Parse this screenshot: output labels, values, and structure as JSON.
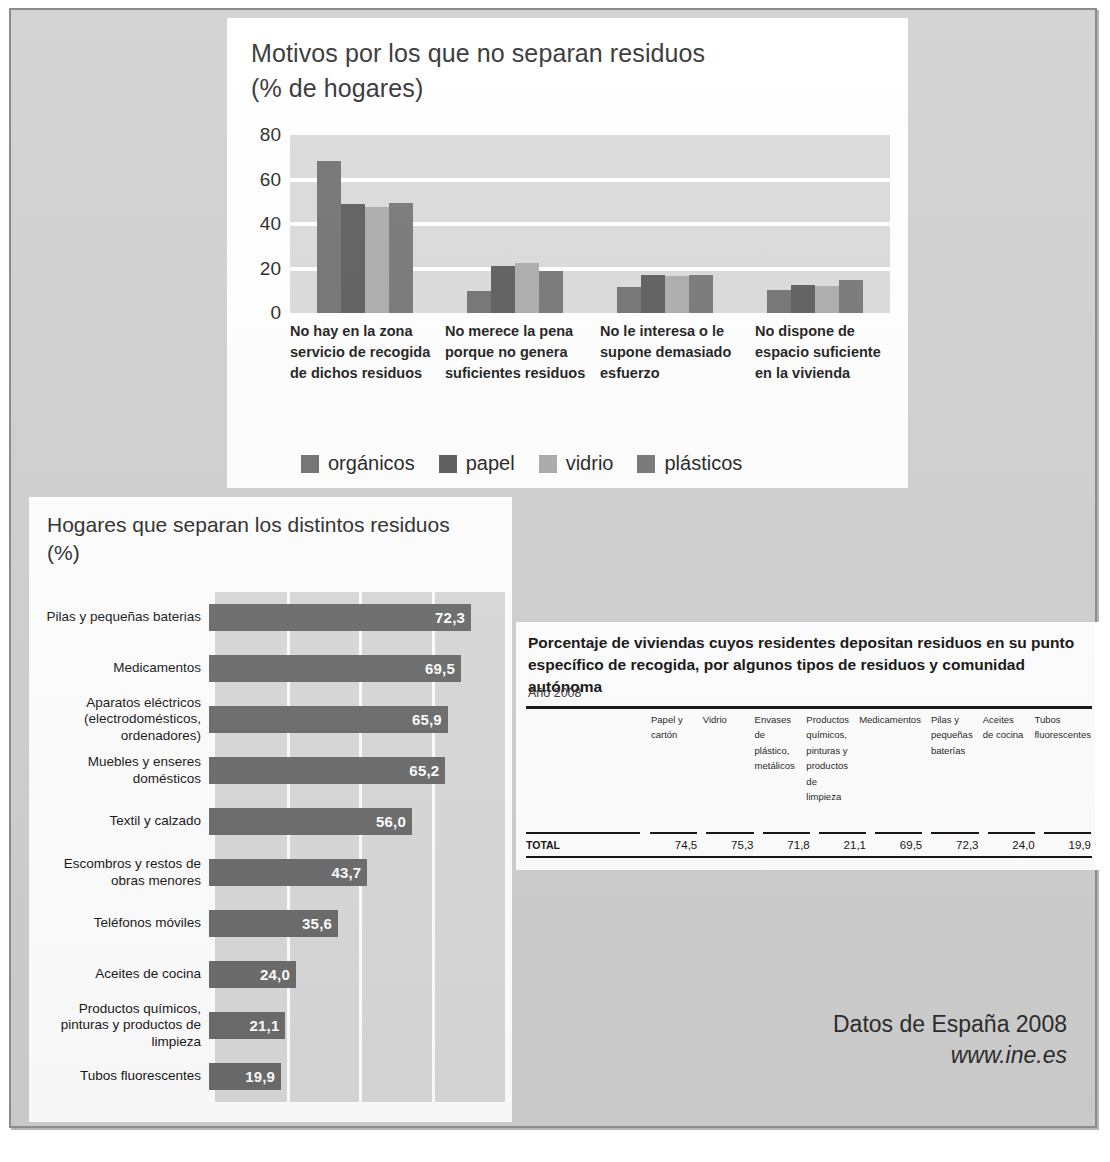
{
  "footer": {
    "line1": "Datos de España 2008",
    "line2": "www.ine.es"
  },
  "panel_top": {
    "title_line1": "Motivos por los que no separan residuos",
    "title_line2": "(% de hogares)"
  },
  "panel_left": {
    "title_line1": "Hogares que separan los distintos residuos",
    "title_line2": "(%)"
  },
  "table": {
    "title_line1": "Porcentaje de viviendas cuyos residentes depositan residuos en su punto",
    "title_line2": "específico de recogida, por algunos tipos de residuos y comunidad autónoma",
    "subtitle": "Año 2008",
    "row_label_header": "",
    "headers": [
      "Papel y cartón",
      "Vidrio",
      "Envases de plástico, metálicos",
      "Productos químicos, pinturas y productos de limpieza",
      "Medicamentos",
      "Pilas y pequeñas baterías",
      "Aceites de cocina",
      "Tubos fluorescentes"
    ],
    "rows": [
      {
        "label": "TOTAL",
        "values": [
          "74,5",
          "75,3",
          "71,8",
          "21,1",
          "69,5",
          "72,3",
          "24,0",
          "19,9"
        ]
      }
    ]
  },
  "chart_data": [
    {
      "type": "bar",
      "id": "motivos-no-separan",
      "title": "Motivos por los que no separan residuos (% de hogares)",
      "xlabel": "",
      "ylabel": "",
      "ylim": [
        0,
        80
      ],
      "yticks": [
        "0",
        "20",
        "40",
        "60",
        "80"
      ],
      "grid": true,
      "legend_position": "bottom",
      "categories": [
        "No hay en la zona servicio de recogida de dichos residuos",
        "No merece la pena porque no genera suficientes residuos",
        "No le interesa o le supone demasiado esfuerzo",
        "No dispone de espacio suficiente en la vivienda"
      ],
      "series": [
        {
          "name": "orgánicos",
          "color": "#6e6e6e",
          "values": [
            68.5,
            9.8,
            11.5,
            10.2
          ]
        },
        {
          "name": "papel",
          "color": "#585858",
          "values": [
            49.2,
            21.3,
            17.0,
            12.5
          ]
        },
        {
          "name": "vidrio",
          "color": "#a9a9a9",
          "values": [
            47.8,
            22.5,
            16.8,
            12.3
          ]
        },
        {
          "name": "plásticos",
          "color": "#737373",
          "values": [
            49.5,
            19.0,
            17.3,
            15.0
          ]
        }
      ]
    },
    {
      "type": "bar",
      "id": "hogares-que-separan",
      "orientation": "horizontal",
      "title": "Hogares que separan los distintos residuos (%)",
      "xlabel": "",
      "ylabel": "",
      "xlim": [
        0,
        80
      ],
      "grid": true,
      "bar_color": "#6b6b6b",
      "categories": [
        "Pilas y pequeñas baterias",
        "Medicamentos",
        "Aparatos eléctricos (electrodomésticos, ordenadores)",
        "Muebles y enseres domésticos",
        "Textil y calzado",
        "Escombros y restos de obras menores",
        "Teléfonos móviles",
        "Aceites de cocina",
        "Productos químicos, pinturas y productos de limpieza",
        "Tubos fluorescentes"
      ],
      "labels_multiline": [
        [
          "Pilas y pequeñas baterias"
        ],
        [
          "Medicamentos"
        ],
        [
          "Aparatos eléctricos",
          "(electrodomésticos,",
          "ordenadores)"
        ],
        [
          "Muebles y enseres",
          "domésticos"
        ],
        [
          "Textil y calzado"
        ],
        [
          "Escombros y restos de",
          "obras menores"
        ],
        [
          "Teléfonos móviles"
        ],
        [
          "Aceites de cocina"
        ],
        [
          "Productos químicos,",
          "pinturas y productos de",
          "limpieza"
        ],
        [
          "Tubos fluorescentes"
        ]
      ],
      "values": [
        72.3,
        69.5,
        65.9,
        65.2,
        56.0,
        43.7,
        35.6,
        24.0,
        21.1,
        19.9
      ],
      "value_labels": [
        "72,3",
        "69,5",
        "65,9",
        "65,2",
        "56,0",
        "43,7",
        "35,6",
        "24,0",
        "21,1",
        "19,9"
      ]
    }
  ]
}
